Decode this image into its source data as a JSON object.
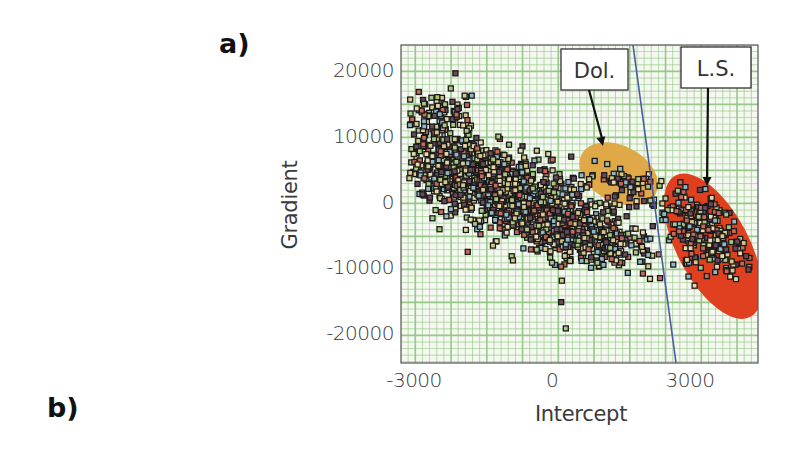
{
  "panels": {
    "a": "a)",
    "b": "b)"
  },
  "chart_data": {
    "type": "scatter",
    "title": "",
    "xlabel": "Intercept",
    "ylabel": "Gradient",
    "xlim": [
      -3300,
      4500
    ],
    "ylim": [
      -24000,
      24000
    ],
    "x_ticks": [
      -3000,
      0,
      3000
    ],
    "x_tick_labels": [
      "-3000",
      "0",
      "3000"
    ],
    "y_ticks": [
      20000,
      10000,
      0,
      -10000,
      -20000
    ],
    "y_tick_labels": [
      "20000",
      "10000",
      "0",
      "-10000",
      "-20000"
    ],
    "grid": true,
    "grid_color": "#8fc47f",
    "background": "#f4f8f0",
    "legend": null,
    "annotations": [
      {
        "label": "Dol.",
        "type": "ellipse-region",
        "color": "#e0a948",
        "center": [
          1450,
          4500
        ],
        "rx_px": 42,
        "ry_px": 28,
        "rotation_deg": 28,
        "box": [
          561,
          49,
          67,
          41
        ],
        "arrow_to": [
          603,
          146
        ]
      },
      {
        "label": "L.S.",
        "type": "ellipse-region",
        "color": "#e0401f",
        "center": [
          3500,
          -6500
        ],
        "rx_px": 36,
        "ry_px": 80,
        "rotation_deg": -28,
        "box": [
          681,
          47,
          70,
          41
        ],
        "arrow_to": [
          707,
          186
        ]
      }
    ],
    "reference_line": {
      "color": "#4a5aa8",
      "points": [
        [
          1800,
          24000
        ],
        [
          2800,
          -24000
        ]
      ]
    },
    "clusters": [
      {
        "name": "main-trend",
        "n": 1300,
        "center": [
          -1200,
          2500
        ],
        "spread": [
          1100,
          5200
        ],
        "slope": -2.6
      },
      {
        "name": "central",
        "n": 420,
        "center": [
          500,
          -4500
        ],
        "spread": [
          850,
          4200
        ],
        "slope": -1.5
      },
      {
        "name": "dolomite",
        "n": 55,
        "center": [
          1500,
          3500
        ],
        "spread": [
          500,
          2200
        ],
        "slope": -1.5
      },
      {
        "name": "limestone",
        "n": 230,
        "center": [
          3300,
          -4500
        ],
        "spread": [
          450,
          5200
        ],
        "slope": -4.0
      },
      {
        "name": "upper-left-tail",
        "n": 80,
        "center": [
          -2300,
          13000
        ],
        "spread": [
          350,
          3200
        ],
        "slope": -1.0
      }
    ],
    "sample_points": [
      [
        -2100,
        19800
      ],
      [
        -2200,
        17500
      ],
      [
        -1900,
        16400
      ],
      [
        -2800,
        9000
      ],
      [
        -2600,
        7200
      ],
      [
        -1500,
        6000
      ],
      [
        -800,
        3000
      ],
      [
        -200,
        1000
      ],
      [
        400,
        -3000
      ],
      [
        0,
        -9000
      ],
      [
        200,
        -15000
      ],
      [
        300,
        -19000
      ],
      [
        1200,
        6000
      ],
      [
        1500,
        3000
      ],
      [
        2400,
        0
      ],
      [
        2900,
        2500
      ],
      [
        3400,
        -4000
      ],
      [
        3700,
        -8000
      ],
      [
        4000,
        -11500
      ],
      [
        3100,
        -12500
      ]
    ],
    "marker": {
      "shape": "square",
      "size": 5,
      "edge": "#1a1a1a",
      "fill_colors": [
        "#d8c888",
        "#8fb8c8",
        "#c86858",
        "#a8c880",
        "#6a4a5a",
        "#e8d8a8"
      ]
    }
  }
}
